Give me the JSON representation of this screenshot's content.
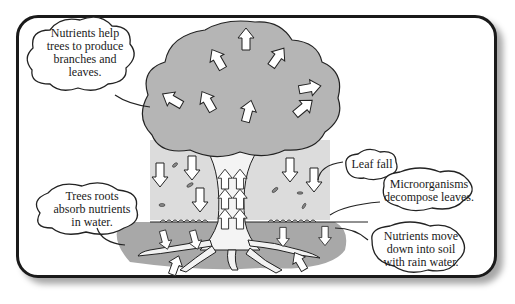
{
  "diagram": {
    "colors": {
      "frame": "#1a1a1a",
      "canopy": "#b5b5b5",
      "soil": "#a8a8a8",
      "air_shade": "#dcdcdc",
      "arrow_fill": "#ffffff",
      "text": "#1a1a1a"
    },
    "labels": {
      "nutrients_help": "Nutrients help trees to produce branches and leaves.",
      "roots_absorb": "Trees roots absorb nutrients in water.",
      "leaf_fall": "Leaf fall",
      "microorganisms": "Microorganisms decompose leaves.",
      "nutrients_move": "Nutrients move down into soil with rain water."
    },
    "lines": {
      "nutrients_help": [
        "Nutrients help",
        "trees to produce",
        "branches and",
        "leaves."
      ],
      "roots_absorb": [
        "Trees roots",
        "absorb nutrients",
        "in water."
      ],
      "leaf_fall": [
        "Leaf fall"
      ],
      "microorganisms": [
        "Microorganisms",
        "decompose leaves."
      ],
      "nutrients_move": [
        "Nutrients move",
        "down into soil",
        "with rain water."
      ]
    }
  }
}
